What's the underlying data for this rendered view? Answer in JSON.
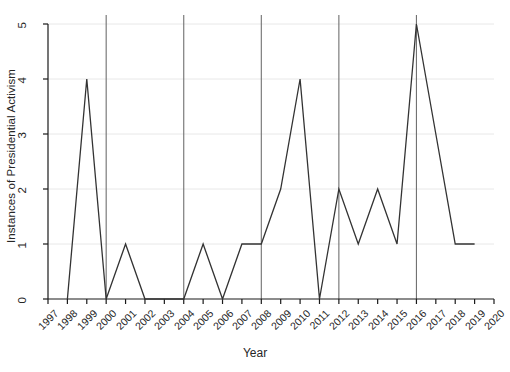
{
  "chart_data": {
    "type": "line",
    "title": "",
    "xlabel": "Year",
    "ylabel": "Instances of Presidential Activism",
    "xlim": [
      1997,
      2020
    ],
    "ylim": [
      0,
      5
    ],
    "yticks": [
      0,
      1,
      2,
      3,
      4,
      5
    ],
    "xticks": [
      1997,
      1998,
      1999,
      2000,
      2001,
      2002,
      2003,
      2004,
      2005,
      2006,
      2007,
      2008,
      2009,
      2010,
      2011,
      2012,
      2013,
      2014,
      2015,
      2016,
      2017,
      2018,
      2019,
      2020
    ],
    "x": [
      1998,
      1999,
      2000,
      2001,
      2002,
      2003,
      2004,
      2005,
      2006,
      2007,
      2008,
      2009,
      2010,
      2011,
      2012,
      2013,
      2014,
      2015,
      2016,
      2017,
      2018,
      2019
    ],
    "values": [
      0,
      4,
      0,
      1,
      0,
      0,
      0,
      1,
      0,
      1,
      1,
      2,
      4,
      0,
      2,
      1,
      2,
      1,
      5,
      3,
      1,
      1
    ],
    "series": [
      {
        "name": "Instances of Presidential Activism",
        "values": [
          0,
          4,
          0,
          1,
          0,
          0,
          0,
          1,
          0,
          1,
          1,
          2,
          4,
          0,
          2,
          1,
          2,
          1,
          5,
          3,
          1,
          1
        ]
      }
    ],
    "vertical_reference_lines": [
      2000,
      2004,
      2008,
      2012,
      2016
    ],
    "grid": "horizontal-only-faint",
    "legend": "none",
    "line_color": "#333333",
    "grid_color": "#e8e8e8",
    "axis_color": "#1a1a1a",
    "reference_line_color": "#707070"
  },
  "axis": {
    "x_title": "Year",
    "y_title": "Instances of Presidential Activism",
    "y_tick_labels": [
      "0",
      "1",
      "2",
      "3",
      "4",
      "5"
    ],
    "x_tick_labels": [
      "1997",
      "1998",
      "1999",
      "2000",
      "2001",
      "2002",
      "2003",
      "2004",
      "2005",
      "2006",
      "2007",
      "2008",
      "2009",
      "2010",
      "2011",
      "2012",
      "2013",
      "2014",
      "2015",
      "2016",
      "2017",
      "2018",
      "2019",
      "2020"
    ]
  }
}
